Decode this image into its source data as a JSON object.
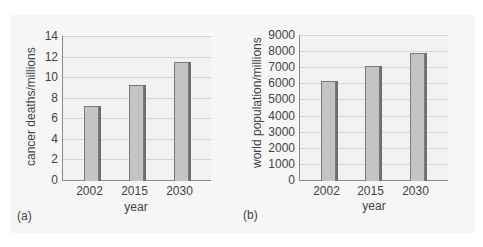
{
  "chart_data": [
    {
      "type": "bar",
      "panel_label": "(a)",
      "title": "",
      "xlabel": "year",
      "ylabel": "cancer deaths/millions",
      "categories": [
        "2002",
        "2015",
        "2030"
      ],
      "values": [
        7.2,
        9.2,
        11.5
      ],
      "ylim": [
        0,
        14
      ],
      "yticks": [
        "0",
        "2",
        "4",
        "6",
        "8",
        "10",
        "12",
        "14"
      ],
      "grid": true,
      "legend": null
    },
    {
      "type": "bar",
      "panel_label": "(b)",
      "title": "",
      "xlabel": "year",
      "ylabel": "world population/millions",
      "categories": [
        "2002",
        "2015",
        "2030"
      ],
      "values": [
        6150,
        7050,
        7900
      ],
      "ylim": [
        0,
        9000
      ],
      "yticks": [
        "0",
        "1000",
        "2000",
        "3000",
        "4000",
        "5000",
        "6000",
        "7000",
        "8000",
        "9000"
      ],
      "grid": true,
      "legend": null
    }
  ],
  "colors": {
    "bar_fill": "#c4c4c4",
    "bar_edge": "#7a7a7a",
    "grid": "#d4d4d4",
    "plot_bg": "#f2f2f2",
    "panel_bg": "#f6f6f6"
  }
}
